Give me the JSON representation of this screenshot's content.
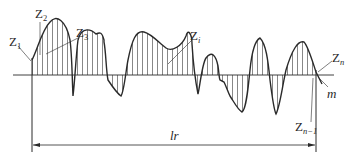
{
  "figure": {
    "type": "surface-roughness-profile",
    "colors": {
      "line": "#2a2a2a",
      "hatch": "#555555",
      "background": "#ffffff"
    }
  },
  "labels": {
    "z1": {
      "base": "Z",
      "sub": "1"
    },
    "z2": {
      "base": "Z",
      "sub": "2"
    },
    "z3": {
      "base": "Z",
      "sub": "3"
    },
    "zi": {
      "base": "Z",
      "sub": "i"
    },
    "zn": {
      "base": "Z",
      "sub": "n"
    },
    "zn1": {
      "base": "Z",
      "sub": "n−1"
    },
    "mean_line": "m",
    "sampling_length": "lr"
  }
}
